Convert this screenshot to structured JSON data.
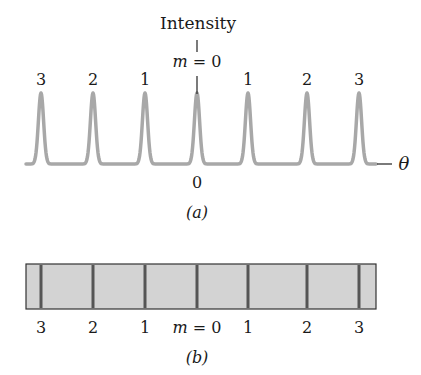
{
  "panel_a": {
    "ylabel": "Intensity",
    "center_label_var": "m",
    "center_label_eq": " = 0",
    "xlabel": "θ",
    "origin_label": "0",
    "caption": "(a)",
    "order_labels": [
      "3",
      "2",
      "1",
      "1",
      "2",
      "3"
    ],
    "curve_color": "#a8a8a8"
  },
  "panel_b": {
    "caption": "(b)",
    "labels": [
      "3",
      "2",
      "1",
      "1",
      "2",
      "3"
    ],
    "center_label_var": "m",
    "center_label_eq": " = 0",
    "fill_color": "#d3d3d3",
    "line_color": "#555555"
  },
  "chart_data": {
    "type": "line",
    "xlabel": "θ",
    "ylabel": "Intensity",
    "peaks": [
      {
        "order": 3,
        "side": "left",
        "intensity": 1
      },
      {
        "order": 2,
        "side": "left",
        "intensity": 1
      },
      {
        "order": 1,
        "side": "left",
        "intensity": 1
      },
      {
        "order": 0,
        "side": "center",
        "intensity": 1
      },
      {
        "order": 1,
        "side": "right",
        "intensity": 1
      },
      {
        "order": 2,
        "side": "right",
        "intensity": 1
      },
      {
        "order": 3,
        "side": "right",
        "intensity": 1
      }
    ],
    "x_tick_labels": [
      "0"
    ],
    "grid": false,
    "legend": "none"
  }
}
